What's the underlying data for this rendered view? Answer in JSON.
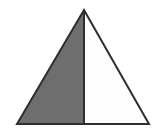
{
  "figure": {
    "name": "triangle-split-half-shaded",
    "canvas": {
      "width": 155,
      "height": 134,
      "background_color": "#ffffff"
    },
    "colors": {
      "shaded_fill": "#6e6e6e",
      "unshaded_fill": "#fdfdfd",
      "outline": "#2e2e2e",
      "divider": "#2e2e2e"
    },
    "stroke_width": 2,
    "vertices": {
      "apex": {
        "x": 84,
        "y": 10
      },
      "bottom_left": {
        "x": 17,
        "y": 124
      },
      "bottom_right": {
        "x": 149,
        "y": 124
      }
    },
    "divider": {
      "top": {
        "x": 84,
        "y": 10
      },
      "bottom": {
        "x": 84,
        "y": 124
      }
    },
    "regions": [
      {
        "name": "left-shaded-region",
        "fill": "#6e6e6e",
        "points": "84,10 17,124 84,124"
      },
      {
        "name": "right-unshaded-region",
        "fill": "#fdfdfd",
        "points": "84,10 84,124 149,124"
      }
    ],
    "outline_points": "84,10 149,124 17,124"
  }
}
